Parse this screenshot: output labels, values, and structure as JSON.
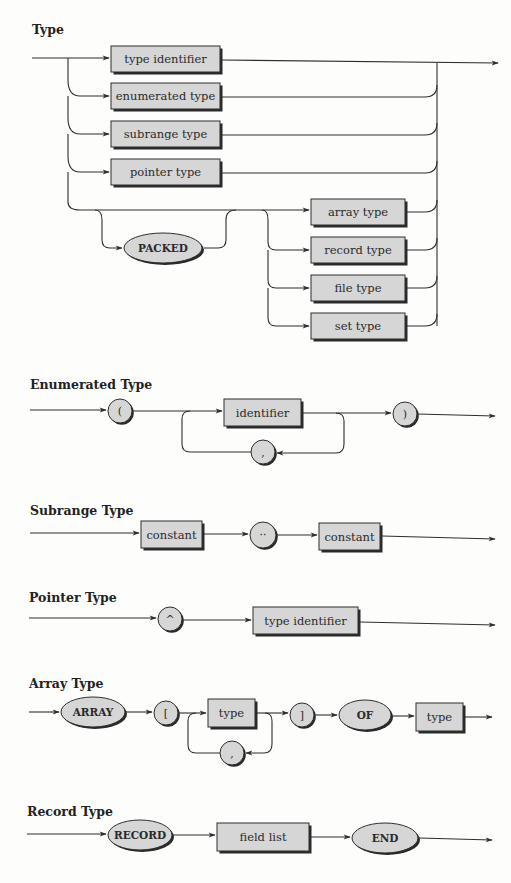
{
  "diagrams": [
    {
      "id": "type",
      "title": "Type",
      "title_pos": [
        32,
        34
      ],
      "boxes": [
        {
          "label": "type identifier",
          "x": 111,
          "y": 46,
          "w": 109,
          "h": 26
        },
        {
          "label": "enumerated type",
          "x": 111,
          "y": 83,
          "w": 109,
          "h": 26
        },
        {
          "label": "subrange type",
          "x": 111,
          "y": 121,
          "w": 109,
          "h": 26
        },
        {
          "label": "pointer type",
          "x": 111,
          "y": 159,
          "w": 109,
          "h": 26
        },
        {
          "label": "array type",
          "x": 311,
          "y": 199,
          "w": 94,
          "h": 26
        },
        {
          "label": "record type",
          "x": 311,
          "y": 237,
          "w": 94,
          "h": 26
        },
        {
          "label": "file type",
          "x": 311,
          "y": 275,
          "w": 94,
          "h": 26
        },
        {
          "label": "set type",
          "x": 311,
          "y": 313,
          "w": 94,
          "h": 26
        }
      ],
      "ovals": [
        {
          "label": "PACKED",
          "cx": 163,
          "cy": 248,
          "rx": 39,
          "ry": 15
        }
      ],
      "circles": []
    },
    {
      "id": "enumerated",
      "title": "Enumerated Type",
      "title_pos": [
        30,
        389
      ],
      "boxes": [
        {
          "label": "identifier",
          "x": 224,
          "y": 399,
          "w": 77,
          "h": 27
        }
      ],
      "ovals": [],
      "circles": [
        {
          "label": "(",
          "cx": 120,
          "cy": 411,
          "r": 12
        },
        {
          "label": ")",
          "cx": 405,
          "cy": 414,
          "r": 12
        },
        {
          "label": ",",
          "cx": 263,
          "cy": 452,
          "r": 12
        }
      ]
    },
    {
      "id": "subrange",
      "title": "Subrange Type",
      "title_pos": [
        30,
        515
      ],
      "boxes": [
        {
          "label": "constant",
          "x": 141,
          "y": 521,
          "w": 61,
          "h": 27
        },
        {
          "label": "constant",
          "x": 319,
          "y": 523,
          "w": 61,
          "h": 27
        }
      ],
      "ovals": [],
      "circles": [
        {
          "label": "··",
          "cx": 263,
          "cy": 535,
          "r": 13
        }
      ]
    },
    {
      "id": "pointer",
      "title": "Pointer Type",
      "title_pos": [
        29,
        602
      ],
      "boxes": [
        {
          "label": "type identifier",
          "x": 253,
          "y": 607,
          "w": 105,
          "h": 27
        }
      ],
      "ovals": [],
      "circles": [
        {
          "label": "^",
          "cx": 170,
          "cy": 619,
          "r": 12
        }
      ]
    },
    {
      "id": "array",
      "title": "Array Type",
      "title_pos": [
        29,
        688
      ],
      "boxes": [
        {
          "label": "type",
          "x": 208,
          "y": 699,
          "w": 47,
          "h": 28
        },
        {
          "label": "type",
          "x": 416,
          "y": 703,
          "w": 47,
          "h": 28
        }
      ],
      "ovals": [
        {
          "label": "ARRAY",
          "cx": 93,
          "cy": 712,
          "rx": 32,
          "ry": 15
        },
        {
          "label": "OF",
          "cx": 365,
          "cy": 715,
          "rx": 26,
          "ry": 15
        }
      ],
      "circles": [
        {
          "label": "[",
          "cx": 166,
          "cy": 713,
          "r": 12
        },
        {
          "label": "]",
          "cx": 302,
          "cy": 715,
          "r": 12
        },
        {
          "label": ",",
          "cx": 232,
          "cy": 753,
          "r": 12
        }
      ]
    },
    {
      "id": "record",
      "title": "Record Type",
      "title_pos": [
        27,
        816
      ],
      "boxes": [
        {
          "label": "field list",
          "x": 217,
          "y": 823,
          "w": 92,
          "h": 28
        }
      ],
      "ovals": [
        {
          "label": "RECORD",
          "cx": 140,
          "cy": 835,
          "rx": 32,
          "ry": 15
        },
        {
          "label": "END",
          "cx": 385,
          "cy": 838,
          "rx": 33,
          "ry": 15
        }
      ],
      "circles": []
    }
  ],
  "colors": {
    "fill": "#d6d6d6",
    "line": "#2e2e2e",
    "shadow": "#2a2a2a",
    "background": "#fdfdfc"
  }
}
